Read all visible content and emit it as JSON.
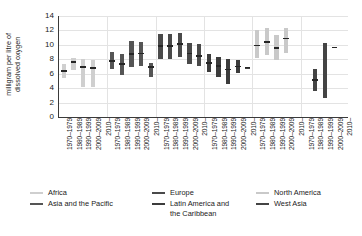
{
  "chart_data": {
    "type": "bar",
    "title": "",
    "subtitle": "",
    "xlabel": "",
    "ylabel": "milligram per litre of\ndissolved oxygen",
    "ylim": [
      0,
      14
    ],
    "yticks": [
      0,
      2,
      4,
      6,
      8,
      10,
      12,
      14
    ],
    "grid": true,
    "legend_position": "bottom",
    "bar_style": "min-max range bar with median tick",
    "categories": [
      "1970–1979",
      "1980–1989",
      "1990–1999",
      "2000–2009",
      "2010–"
    ],
    "series": [
      {
        "name": "Africa",
        "color": "#cfcfcf",
        "points": [
          {
            "period": "1970–1979",
            "min": 5.4,
            "max": 7.4,
            "median": 6.4
          },
          {
            "period": "1980–1989",
            "min": 6.5,
            "max": 8.2,
            "median": 7.6
          },
          {
            "period": "1990–1999",
            "min": 4.2,
            "max": 8.0,
            "median": 6.9
          },
          {
            "period": "2000–2009",
            "min": 4.2,
            "max": 7.9,
            "median": 6.8
          },
          {
            "period": "2010–",
            "min": null,
            "max": null,
            "median": null
          }
        ]
      },
      {
        "name": "Asia and the Pacific",
        "color": "#555555",
        "points": [
          {
            "period": "1970–1979",
            "min": 6.6,
            "max": 9.0,
            "median": 7.8
          },
          {
            "period": "1980–1989",
            "min": 5.8,
            "max": 8.8,
            "median": 7.3
          },
          {
            "period": "1990–1999",
            "min": 6.9,
            "max": 10.5,
            "median": 8.7
          },
          {
            "period": "2000–2009",
            "min": 7.0,
            "max": 10.4,
            "median": 8.8
          },
          {
            "period": "2010–",
            "min": 5.6,
            "max": 7.5,
            "median": 6.9
          }
        ]
      },
      {
        "name": "Europe",
        "color": "#4a4a4a",
        "points": [
          {
            "period": "1970–1979",
            "min": 8.0,
            "max": 11.5,
            "median": 9.8
          },
          {
            "period": "1980–1989",
            "min": 8.1,
            "max": 11.5,
            "median": 9.8
          },
          {
            "period": "1990–1999",
            "min": 8.3,
            "max": 11.6,
            "median": 10.1
          },
          {
            "period": "2000–2009",
            "min": 7.3,
            "max": 10.3,
            "median": 8.8
          },
          {
            "period": "2010–",
            "min": 7.0,
            "max": 10.1,
            "median": 8.5
          }
        ]
      },
      {
        "name": "Latin America and the Caribbean",
        "color": "#3c3c3c",
        "points": [
          {
            "period": "1970–1979",
            "min": 6.2,
            "max": 8.8,
            "median": 7.5
          },
          {
            "period": "1980–1989",
            "min": 5.6,
            "max": 8.3,
            "median": 7.1
          },
          {
            "period": "1990–1999",
            "min": 4.6,
            "max": 8.0,
            "median": 6.6
          },
          {
            "period": "2000–2009",
            "min": 6.1,
            "max": 7.9,
            "median": 7.0
          },
          {
            "period": "2010–",
            "min": 6.8,
            "max": 6.9,
            "median": 6.85
          }
        ]
      },
      {
        "name": "North America",
        "color": "#c9c9c9",
        "points": [
          {
            "period": "1970–1979",
            "min": 8.2,
            "max": 12.1,
            "median": 9.9
          },
          {
            "period": "1980–1989",
            "min": 8.6,
            "max": 12.3,
            "median": 10.4
          },
          {
            "period": "1990–1999",
            "min": 7.9,
            "max": 11.3,
            "median": 9.6
          },
          {
            "period": "2000–2009",
            "min": 8.9,
            "max": 12.4,
            "median": 10.9
          },
          {
            "period": "2010–",
            "min": null,
            "max": null,
            "median": null
          }
        ]
      },
      {
        "name": "West Asia",
        "color": "#444444",
        "points": [
          {
            "period": "1970–1979",
            "min": null,
            "max": null,
            "median": null
          },
          {
            "period": "1980–1989",
            "min": 3.6,
            "max": 6.6,
            "median": 5.1
          },
          {
            "period": "1990–1999",
            "min": 2.6,
            "max": 10.3,
            "median": null
          },
          {
            "period": "2000–2009",
            "min": 9.6,
            "max": 9.7,
            "median": 9.65
          },
          {
            "period": "2010–",
            "min": null,
            "max": null,
            "median": null
          }
        ]
      }
    ]
  },
  "legend": {
    "columns": [
      [
        {
          "label": "Africa",
          "color": "#cfcfcf"
        },
        {
          "label": "Asia and the Pacific",
          "color": "#555555"
        }
      ],
      [
        {
          "label": "Europe",
          "color": "#4a4a4a"
        },
        {
          "label": "Latin America and\nthe Caribbean",
          "color": "#3c3c3c"
        }
      ],
      [
        {
          "label": "North America",
          "color": "#c9c9c9"
        },
        {
          "label": "West Asia",
          "color": "#444444"
        }
      ]
    ]
  }
}
